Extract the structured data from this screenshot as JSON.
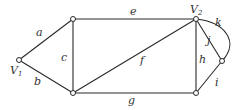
{
  "diagram": {
    "type": "graph",
    "vertices": [
      {
        "id": "v1",
        "label": "V",
        "sub": "1",
        "x": 19,
        "y": 60
      },
      {
        "id": "tl",
        "label": "",
        "x": 73,
        "y": 19
      },
      {
        "id": "bl",
        "label": "",
        "x": 73,
        "y": 93
      },
      {
        "id": "v2",
        "label": "V",
        "sub": "2",
        "x": 196,
        "y": 19
      },
      {
        "id": "br",
        "label": "",
        "x": 196,
        "y": 93
      },
      {
        "id": "r",
        "label": "",
        "x": 222,
        "y": 61
      }
    ],
    "edges": [
      {
        "label": "a",
        "from": "v1",
        "to": "tl"
      },
      {
        "label": "b",
        "from": "v1",
        "to": "bl"
      },
      {
        "label": "c",
        "from": "tl",
        "to": "bl"
      },
      {
        "label": "e",
        "from": "tl",
        "to": "v2"
      },
      {
        "label": "f",
        "from": "bl",
        "to": "v2"
      },
      {
        "label": "g",
        "from": "bl",
        "to": "br"
      },
      {
        "label": "h",
        "from": "v2",
        "to": "br"
      },
      {
        "label": "i",
        "from": "br",
        "to": "r"
      },
      {
        "label": "j",
        "from": "v2",
        "to": "r"
      },
      {
        "label": "k",
        "from": "v2",
        "to": "r",
        "curved": true
      }
    ]
  }
}
